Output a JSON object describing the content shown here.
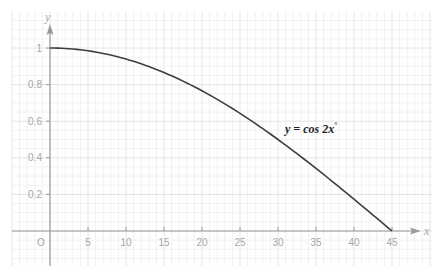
{
  "chart_data": {
    "type": "line",
    "title": "",
    "xlabel": "x",
    "ylabel": "y",
    "origin_label": "O",
    "xlim": [
      -5,
      50
    ],
    "ylim": [
      -0.18,
      1.18
    ],
    "x_ticks": [
      5,
      10,
      15,
      20,
      25,
      30,
      35,
      40,
      45
    ],
    "x_tick_labels": [
      "5",
      "10",
      "15",
      "20",
      "25",
      "30",
      "35",
      "40",
      "45"
    ],
    "y_ticks": [
      0.2,
      0.4,
      0.6,
      0.8,
      1
    ],
    "y_tick_labels": [
      "0.2",
      "0.4",
      "0.6",
      "0.8",
      "1"
    ],
    "grid": true,
    "series": [
      {
        "name": "y = cos 2x°",
        "label_text": "y = cos 2x",
        "label_superscript": "°",
        "function": "cos(2x degrees)",
        "x": [
          0,
          5,
          10,
          15,
          20,
          25,
          30,
          35,
          40,
          45
        ],
        "values": [
          1,
          0.985,
          0.94,
          0.866,
          0.766,
          0.643,
          0.5,
          0.342,
          0.174,
          0
        ]
      }
    ]
  },
  "colors": {
    "grid": "#eeeeee",
    "axis": "#9a9a9a",
    "curve": "#3d3d3d",
    "tick_text": "#a6a6a6",
    "label_text": "#222222"
  }
}
